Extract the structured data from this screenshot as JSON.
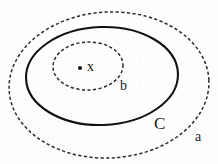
{
  "diagram": {
    "background_color": "#fdfdfd",
    "stroke_color": "#1a1a1a",
    "width": 218,
    "height": 164,
    "shapes": [
      {
        "name": "outer-ellipse-a",
        "label": "a",
        "style": "dashed",
        "cx": 109,
        "cy": 85,
        "rx": 100,
        "ry": 73,
        "stroke": "#2b2b2b",
        "stroke_width": 1.5
      },
      {
        "name": "middle-ellipse-C",
        "label": "C",
        "style": "solid",
        "cx": 102,
        "cy": 76,
        "rx": 76,
        "ry": 49,
        "stroke": "#111111",
        "stroke_width": 2.1
      },
      {
        "name": "inner-ellipse-b",
        "label": "b",
        "style": "dashed",
        "cx": 88,
        "cy": 66,
        "rx": 35,
        "ry": 24,
        "stroke": "#2b2b2b",
        "stroke_width": 1.5
      }
    ],
    "point": {
      "name": "point-x",
      "label": "x",
      "cx": 80,
      "cy": 68,
      "radius": 2.1,
      "color": "#1a1a1a"
    },
    "labels": {
      "outer": "a",
      "middle": "C",
      "inner": "b",
      "point": "x"
    }
  }
}
